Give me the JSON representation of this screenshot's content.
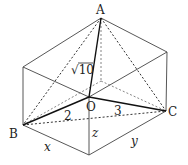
{
  "figure": {
    "type": "tetrahedron inscribed in rectangular box",
    "points": {
      "A": "A",
      "B": "B",
      "C": "C",
      "O": "O"
    },
    "edge_labels": {
      "OA": "√10",
      "OB": "2",
      "OC": "3"
    },
    "dimension_labels": {
      "x": "x",
      "y": "y",
      "z": "z"
    }
  }
}
